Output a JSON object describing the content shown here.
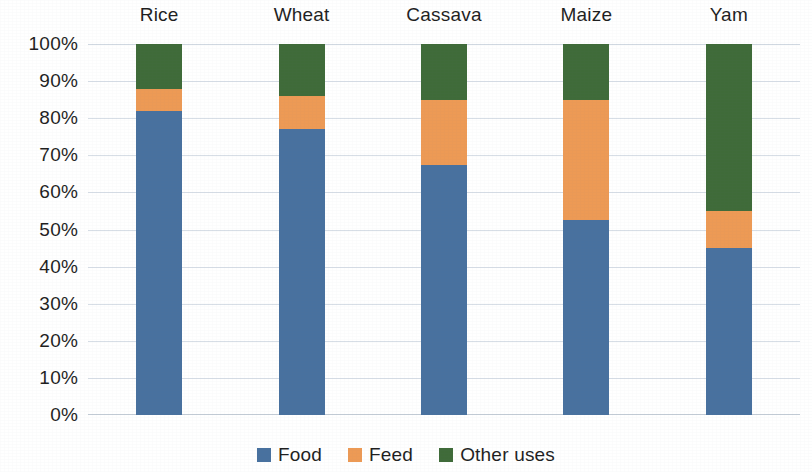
{
  "chart_data": {
    "type": "bar",
    "subtype": "stacked-100-percent",
    "title": "",
    "xlabel": "",
    "ylabel": "",
    "categories": [
      "Rice",
      "Wheat",
      "Cassava",
      "Maize",
      "Yam"
    ],
    "series": [
      {
        "name": "Food",
        "color": "#48719f",
        "values": [
          82,
          77,
          67.5,
          52.5,
          45
        ]
      },
      {
        "name": "Feed",
        "color": "#ed9a55",
        "values": [
          6,
          9,
          17.5,
          32.5,
          10
        ]
      },
      {
        "name": "Other uses",
        "color": "#3f6b39",
        "values": [
          12,
          14,
          15,
          15,
          45
        ]
      }
    ],
    "ylim": [
      0,
      100
    ],
    "y_tick_labels": [
      "100%",
      "90%",
      "80%",
      "70%",
      "60%",
      "50%",
      "40%",
      "30%",
      "20%",
      "10%",
      "0%"
    ],
    "y_tick_values": [
      100,
      90,
      80,
      70,
      60,
      50,
      40,
      30,
      20,
      10,
      0
    ],
    "grid": true,
    "grid_axis": "y",
    "legend_position": "bottom",
    "category_label_position": "top",
    "stack_order_bottom_to_top": [
      "Food",
      "Feed",
      "Other uses"
    ],
    "cumulative_tops": {
      "Rice": {
        "Food": 82,
        "Feed": 88,
        "Other uses": 100
      },
      "Wheat": {
        "Food": 77,
        "Feed": 86,
        "Other uses": 100
      },
      "Cassava": {
        "Food": 67.5,
        "Feed": 85,
        "Other uses": 100
      },
      "Maize": {
        "Food": 52.5,
        "Feed": 85,
        "Other uses": 100
      },
      "Yam": {
        "Food": 45,
        "Feed": 55,
        "Other uses": 100
      }
    }
  },
  "legend": {
    "items": [
      {
        "label": "Food",
        "color": "#48719f"
      },
      {
        "label": "Feed",
        "color": "#ed9a55"
      },
      {
        "label": "Other uses",
        "color": "#3f6b39"
      }
    ]
  },
  "colors": {
    "food": "#48719f",
    "feed": "#ed9a55",
    "other_uses": "#3f6b39",
    "gridline": "#d7dee6",
    "text": "#1f1f1f",
    "background": "#ffffff"
  }
}
